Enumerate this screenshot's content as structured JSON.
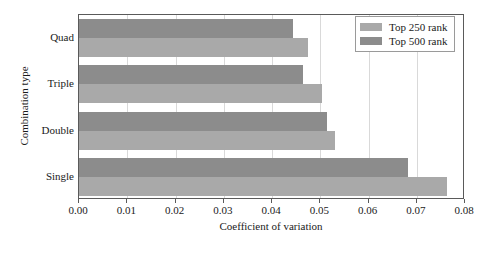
{
  "chart_data": {
    "type": "bar",
    "orientation": "horizontal",
    "title": "",
    "xlabel": "Coefficient of variation",
    "ylabel": "Combination type",
    "categories": [
      "Single",
      "Double",
      "Triple",
      "Quad"
    ],
    "categories_top_to_bottom": [
      "Quad",
      "Triple",
      "Double",
      "Single"
    ],
    "series": [
      {
        "name": "Top 250 rank",
        "color": "#a9a9a9",
        "values": [
          0.0763,
          0.053,
          0.0503,
          0.0474
        ]
      },
      {
        "name": "Top 500 rank",
        "color": "#8c8c8c",
        "values": [
          0.0681,
          0.0513,
          0.0465,
          0.0443
        ]
      }
    ],
    "xlim": [
      0.0,
      0.08
    ],
    "xticks": [
      0.0,
      0.01,
      0.02,
      0.03,
      0.04,
      0.05,
      0.06,
      0.07,
      0.08
    ],
    "xtick_labels": [
      "0.00",
      "0.01",
      "0.02",
      "0.03",
      "0.04",
      "0.05",
      "0.06",
      "0.07",
      "0.08"
    ],
    "grid": "vertical",
    "legend_position": "top-right",
    "frame": true
  },
  "legend": {
    "entries": [
      {
        "label": "Top 250 rank",
        "color": "#a9a9a9"
      },
      {
        "label": "Top 500 rank",
        "color": "#8c8c8c"
      }
    ]
  },
  "colors": {
    "top250": "#a9a9a9",
    "top500": "#8c8c8c",
    "grid": "#d9d9d9",
    "frame": "#5a5a5a",
    "background": "#ffffff",
    "text": "#1a1a1a"
  }
}
